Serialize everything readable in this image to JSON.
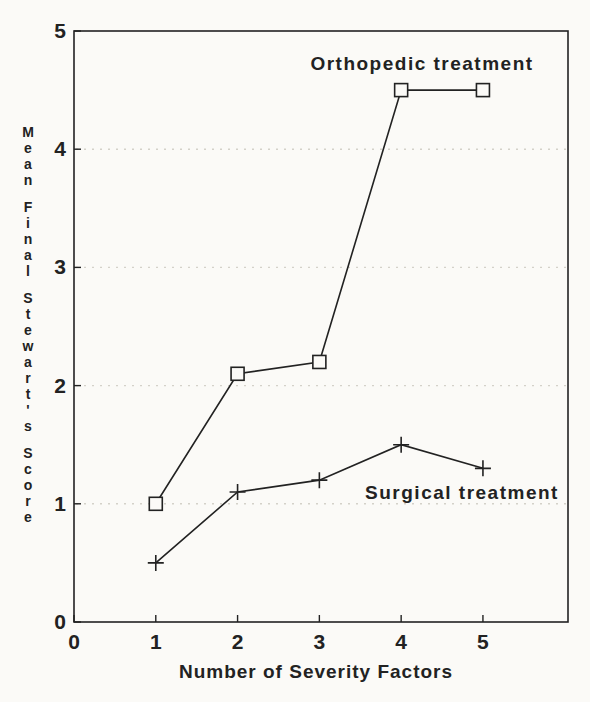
{
  "figure": {
    "background": "#fbfaf7",
    "ink": "#222222",
    "grid_color": "#d4d1c9"
  },
  "chart_data": {
    "type": "line",
    "title": "",
    "xlabel": "Number of Severity Factors",
    "ylabel": "Mean Final Stewart's Score",
    "xlim": [
      0,
      6.04
    ],
    "ylim": [
      0,
      5
    ],
    "x_ticks": [
      0,
      1,
      2,
      3,
      4,
      5
    ],
    "y_ticks": [
      0,
      1,
      2,
      3,
      4,
      5
    ],
    "grid_y_values": [
      1,
      2,
      3,
      4
    ],
    "grid_style": "dotted-horizontal",
    "legend_position": "inline-annotations",
    "series": [
      {
        "name": "Orthopedic treatment",
        "marker": "square",
        "x": [
          1,
          2,
          3,
          4,
          5
        ],
        "values": [
          1.0,
          2.1,
          2.2,
          4.5,
          4.5
        ]
      },
      {
        "name": "Surgical treatment",
        "marker": "plus",
        "x": [
          1,
          2,
          3,
          4,
          5
        ],
        "values": [
          0.5,
          1.1,
          1.2,
          1.5,
          1.3
        ]
      }
    ]
  }
}
